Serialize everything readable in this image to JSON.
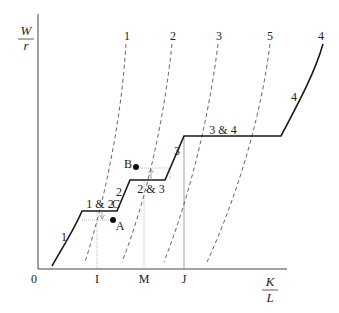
{
  "axes": {
    "y_label_num": "W",
    "y_label_den": "r",
    "x_label_num": "K",
    "x_label_den": "L",
    "origin": "0",
    "x_ticks": [
      "I",
      "M",
      "J"
    ]
  },
  "curve_labels_top": [
    "1",
    "2",
    "3",
    "5",
    "4"
  ],
  "segment_labels": {
    "seg1": "1",
    "flat12": "1 & 2",
    "seg2": "2",
    "flat23": "2 & 3",
    "seg3": "3",
    "flat34": "3 & 4",
    "seg4": "4"
  },
  "points": {
    "A": "A",
    "B": "B",
    "C": "C"
  },
  "colors": {
    "line": "#1a1a1a",
    "dashed": "#555555",
    "dotted": "#999999",
    "arrow": "#888888"
  }
}
